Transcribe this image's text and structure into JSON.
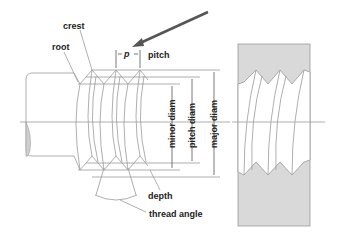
{
  "diagram": {
    "labels": {
      "crest": "crest",
      "root": "root",
      "p": "p",
      "pitch": "pitch",
      "minor_diam": "minor diam",
      "pitch_diam": "pitch diam",
      "major_diam": "major diam",
      "depth": "depth",
      "thread_angle": "thread angle"
    },
    "colors": {
      "line": "#9a9a9a",
      "text": "#222222",
      "arrow": "#555555",
      "section_fill": "#d9d9d9"
    }
  }
}
